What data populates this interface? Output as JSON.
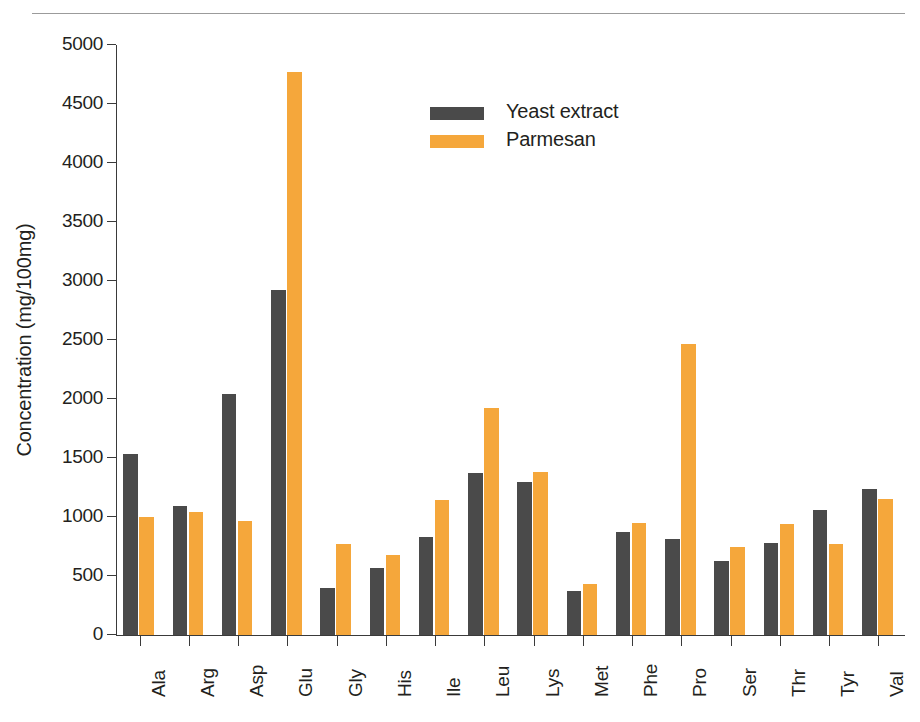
{
  "figure": {
    "rule_present": true
  },
  "legend": {
    "position": "top-center-right",
    "entries": [
      {
        "label": "Yeast extract",
        "color": "#4a4a4a",
        "swatch": "dark-swatch"
      },
      {
        "label": "Parmesan",
        "color": "#f5a73b",
        "swatch": "orange-swatch"
      }
    ]
  },
  "chart_data": {
    "type": "bar",
    "title": "",
    "xlabel": "",
    "ylabel": "Concentration (mg/100mg)",
    "ylim": [
      0,
      5000
    ],
    "ytick_step": 500,
    "yticks": [
      0,
      500,
      1000,
      1500,
      2000,
      2500,
      3000,
      3500,
      4000,
      4500,
      5000
    ],
    "ytick_labels": [
      "0",
      "500",
      "1000",
      "1500",
      "2000",
      "2500",
      "3000",
      "3500",
      "4000",
      "4500",
      "5000"
    ],
    "grid": false,
    "xtick_rotation": 90,
    "categories": [
      "Ala",
      "Arg",
      "Asp",
      "Glu",
      "Gly",
      "His",
      "Ile",
      "Leu",
      "Lys",
      "Met",
      "Phe",
      "Pro",
      "Ser",
      "Thr",
      "Tyr",
      "Val"
    ],
    "series": [
      {
        "name": "Yeast extract",
        "color": "#4a4a4a",
        "values": [
          1530,
          1090,
          2040,
          2920,
          400,
          570,
          830,
          1370,
          1300,
          370,
          870,
          810,
          630,
          780,
          1060,
          1240
        ]
      },
      {
        "name": "Parmesan",
        "color": "#f5a73b",
        "values": [
          1000,
          1040,
          970,
          4770,
          770,
          680,
          1140,
          1920,
          1385,
          430,
          950,
          2470,
          750,
          940,
          770,
          1155
        ]
      }
    ]
  }
}
